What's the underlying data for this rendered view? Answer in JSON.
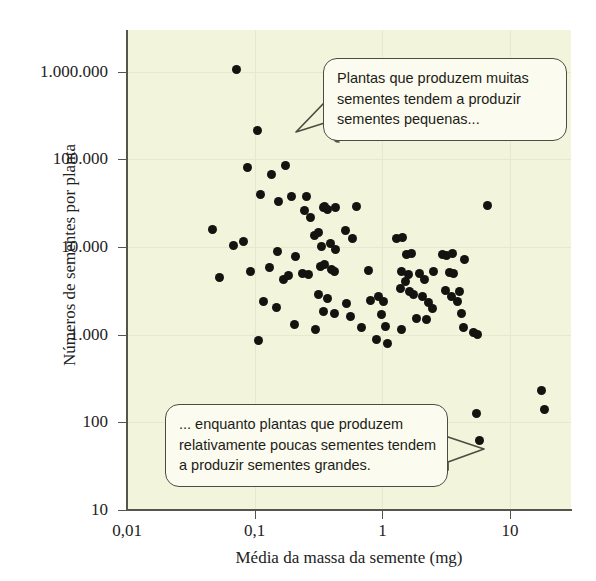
{
  "figure": {
    "background_color": "#f2f4dc",
    "dot_color": "#131310",
    "axis_color": "#55564a",
    "callout_border_color": "#4c4c42"
  },
  "annotations": {
    "top": {
      "name": "callout-many-small-seeds",
      "lines": [
        "Plantas que produzem muitas",
        "sementes tendem a produzir",
        "sementes pequenas..."
      ]
    },
    "bottom": {
      "name": "callout-few-large-seeds",
      "lines": [
        "... enquanto plantas que produzem",
        "relativamente poucas sementes tendem",
        "a produzir sementes grandes."
      ]
    }
  },
  "chart_data": {
    "type": "scatter",
    "title": "",
    "xlabel": "Média da massa da semente (mg)",
    "ylabel": "Números de sementes por planta",
    "xscale": "log",
    "yscale": "log",
    "xlim": [
      0.01,
      30
    ],
    "ylim": [
      10,
      3000000
    ],
    "grid": true,
    "legend": null,
    "xticks": [
      {
        "value": 0.01,
        "label": "0,01"
      },
      {
        "value": 0.1,
        "label": "0,1"
      },
      {
        "value": 1,
        "label": "1"
      },
      {
        "value": 10,
        "label": "10"
      }
    ],
    "yticks": [
      {
        "value": 10,
        "label": "10"
      },
      {
        "value": 100,
        "label": "100"
      },
      {
        "value": 1000,
        "label": "1.000"
      },
      {
        "value": 10000,
        "label": "10.000"
      },
      {
        "value": 100000,
        "label": "100.000"
      },
      {
        "value": 1000000,
        "label": "1.000.000"
      }
    ],
    "points": [
      {
        "x": 0.072,
        "y": 1050000
      },
      {
        "x": 0.105,
        "y": 215000
      },
      {
        "x": 0.088,
        "y": 82000
      },
      {
        "x": 0.135,
        "y": 68000
      },
      {
        "x": 0.175,
        "y": 85000
      },
      {
        "x": 0.112,
        "y": 40000
      },
      {
        "x": 0.155,
        "y": 33000
      },
      {
        "x": 0.195,
        "y": 38000
      },
      {
        "x": 0.255,
        "y": 38000
      },
      {
        "x": 0.047,
        "y": 16000
      },
      {
        "x": 0.068,
        "y": 10500
      },
      {
        "x": 0.082,
        "y": 11500
      },
      {
        "x": 0.245,
        "y": 26000
      },
      {
        "x": 0.275,
        "y": 22000
      },
      {
        "x": 0.295,
        "y": 13500
      },
      {
        "x": 0.053,
        "y": 4500
      },
      {
        "x": 0.092,
        "y": 5200
      },
      {
        "x": 0.131,
        "y": 5800
      },
      {
        "x": 0.151,
        "y": 8800
      },
      {
        "x": 0.168,
        "y": 4300
      },
      {
        "x": 0.183,
        "y": 4700
      },
      {
        "x": 0.208,
        "y": 7800
      },
      {
        "x": 0.235,
        "y": 5000
      },
      {
        "x": 0.262,
        "y": 4900
      },
      {
        "x": 0.118,
        "y": 2400
      },
      {
        "x": 0.148,
        "y": 2050
      },
      {
        "x": 0.107,
        "y": 860
      },
      {
        "x": 0.205,
        "y": 1300
      },
      {
        "x": 0.345,
        "y": 28000
      },
      {
        "x": 0.355,
        "y": 29000
      },
      {
        "x": 0.37,
        "y": 26500
      },
      {
        "x": 0.43,
        "y": 28000
      },
      {
        "x": 0.625,
        "y": 29000
      },
      {
        "x": 0.315,
        "y": 14500
      },
      {
        "x": 0.335,
        "y": 10200
      },
      {
        "x": 0.39,
        "y": 11000
      },
      {
        "x": 0.43,
        "y": 9400
      },
      {
        "x": 0.51,
        "y": 15500
      },
      {
        "x": 0.58,
        "y": 12500
      },
      {
        "x": 0.33,
        "y": 6000
      },
      {
        "x": 0.352,
        "y": 6300
      },
      {
        "x": 0.398,
        "y": 5500
      },
      {
        "x": 0.425,
        "y": 5200
      },
      {
        "x": 0.315,
        "y": 2900
      },
      {
        "x": 0.37,
        "y": 2600
      },
      {
        "x": 0.345,
        "y": 1850
      },
      {
        "x": 0.42,
        "y": 1750
      },
      {
        "x": 0.3,
        "y": 1150
      },
      {
        "x": 0.52,
        "y": 2300
      },
      {
        "x": 0.56,
        "y": 1600
      },
      {
        "x": 0.69,
        "y": 1200
      },
      {
        "x": 0.78,
        "y": 5400
      },
      {
        "x": 0.81,
        "y": 2450
      },
      {
        "x": 0.93,
        "y": 2750
      },
      {
        "x": 1.02,
        "y": 2400
      },
      {
        "x": 0.98,
        "y": 1700
      },
      {
        "x": 1.05,
        "y": 1250
      },
      {
        "x": 0.9,
        "y": 890
      },
      {
        "x": 1.1,
        "y": 800
      },
      {
        "x": 1.3,
        "y": 12500
      },
      {
        "x": 1.45,
        "y": 12800
      },
      {
        "x": 1.55,
        "y": 8200
      },
      {
        "x": 1.7,
        "y": 8400
      },
      {
        "x": 1.42,
        "y": 5200
      },
      {
        "x": 1.6,
        "y": 4900
      },
      {
        "x": 1.52,
        "y": 4100
      },
      {
        "x": 1.38,
        "y": 3400
      },
      {
        "x": 1.62,
        "y": 3150
      },
      {
        "x": 1.75,
        "y": 2900
      },
      {
        "x": 1.95,
        "y": 5000
      },
      {
        "x": 2.15,
        "y": 4300
      },
      {
        "x": 2.05,
        "y": 2750
      },
      {
        "x": 2.3,
        "y": 2350
      },
      {
        "x": 2.45,
        "y": 2000
      },
      {
        "x": 2.2,
        "y": 1500
      },
      {
        "x": 1.85,
        "y": 1550
      },
      {
        "x": 1.4,
        "y": 1150
      },
      {
        "x": 2.5,
        "y": 5300
      },
      {
        "x": 2.95,
        "y": 8200
      },
      {
        "x": 3.2,
        "y": 8000
      },
      {
        "x": 3.55,
        "y": 8400
      },
      {
        "x": 3.35,
        "y": 5100
      },
      {
        "x": 3.6,
        "y": 5000
      },
      {
        "x": 3.1,
        "y": 3200
      },
      {
        "x": 3.5,
        "y": 2700
      },
      {
        "x": 3.9,
        "y": 2400
      },
      {
        "x": 4.4,
        "y": 7300
      },
      {
        "x": 4.0,
        "y": 3150
      },
      {
        "x": 4.15,
        "y": 1750
      },
      {
        "x": 4.35,
        "y": 1200
      },
      {
        "x": 5.2,
        "y": 1050
      },
      {
        "x": 5.6,
        "y": 1000
      },
      {
        "x": 6.6,
        "y": 30000
      },
      {
        "x": 5.5,
        "y": 125
      },
      {
        "x": 5.8,
        "y": 62
      },
      {
        "x": 17.5,
        "y": 230
      },
      {
        "x": 18.5,
        "y": 140
      }
    ]
  }
}
